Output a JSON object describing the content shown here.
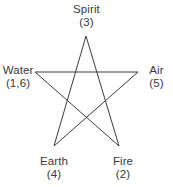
{
  "figure": {
    "name": "pentagram-elements-diagram",
    "background_color": "#ffffff",
    "line_color": "#3c3c3c",
    "text_color": "#3a3a3a",
    "stroke_width": 1
  },
  "vertices": [
    {
      "id": "spirit",
      "name": "Spirit",
      "value": "(3)",
      "x": 86,
      "y": 36,
      "position": "top"
    },
    {
      "id": "air",
      "name": "Air",
      "value": "(5)",
      "x": 138,
      "y": 72,
      "position": "right"
    },
    {
      "id": "fire",
      "name": "Fire",
      "value": "(2)",
      "x": 119,
      "y": 146,
      "position": "bottom-right"
    },
    {
      "id": "earth",
      "name": "Earth",
      "value": "(4)",
      "x": 54,
      "y": 146,
      "position": "bottom-left"
    },
    {
      "id": "water",
      "name": "Water",
      "value": "(1,6)",
      "x": 35,
      "y": 72,
      "position": "left"
    }
  ],
  "star_path": "M 86,36 L 119,146 L 35,72 L 138,72 L 54,146 Z"
}
